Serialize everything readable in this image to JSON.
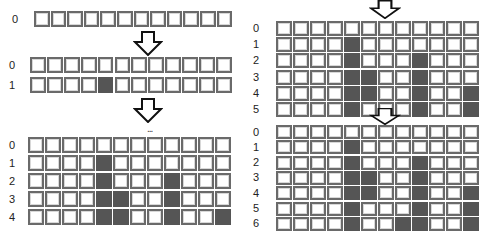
{
  "colors": {
    "filled": "#555555",
    "border": "#6a6a6a",
    "empty": "#ffffff"
  },
  "columns": 12,
  "grids": [
    {
      "id": "step-1",
      "x": 34,
      "y": 11,
      "cellW": 16.6,
      "cellH": 16,
      "pitchY": 18,
      "labelX": 12,
      "rows": [
        {
          "label": "0",
          "filled": []
        }
      ]
    },
    {
      "id": "step-2",
      "x": 30,
      "y": 57,
      "cellW": 16.9,
      "cellH": 16,
      "pitchY": 20,
      "labelX": 9,
      "rows": [
        {
          "label": "0",
          "filled": []
        },
        {
          "label": "1",
          "filled": [
            4
          ]
        }
      ]
    },
    {
      "id": "step-3",
      "x": 28,
      "y": 137,
      "cellW": 17.0,
      "cellH": 16,
      "pitchY": 18,
      "labelX": 9,
      "rows": [
        {
          "label": "0",
          "filled": []
        },
        {
          "label": "1",
          "filled": [
            4
          ]
        },
        {
          "label": "2",
          "filled": [
            4,
            8
          ]
        },
        {
          "label": "3",
          "filled": [
            4,
            5,
            8
          ]
        },
        {
          "label": "4",
          "filled": [
            4,
            5,
            8,
            11
          ]
        }
      ]
    },
    {
      "id": "step-4",
      "x": 276,
      "y": 21,
      "cellW": 17.0,
      "cellH": 15,
      "pitchY": 16.2,
      "labelX": 253,
      "rows": [
        {
          "label": "0",
          "filled": []
        },
        {
          "label": "1",
          "filled": [
            4
          ]
        },
        {
          "label": "2",
          "filled": [
            4,
            8
          ]
        },
        {
          "label": "3",
          "filled": [
            4,
            5,
            8
          ]
        },
        {
          "label": "4",
          "filled": [
            4,
            5,
            8,
            11
          ]
        },
        {
          "label": "5",
          "filled": [
            4,
            8,
            11
          ]
        }
      ]
    },
    {
      "id": "step-5",
      "x": 276,
      "y": 125,
      "cellW": 17.0,
      "cellH": 14,
      "pitchY": 15.3,
      "labelX": 253,
      "rows": [
        {
          "label": "0",
          "filled": []
        },
        {
          "label": "1",
          "filled": [
            4
          ]
        },
        {
          "label": "2",
          "filled": [
            4,
            8
          ]
        },
        {
          "label": "3",
          "filled": [
            4,
            5,
            8
          ]
        },
        {
          "label": "4",
          "filled": [
            4,
            5,
            8,
            11
          ]
        },
        {
          "label": "5",
          "filled": [
            4,
            8,
            11
          ]
        },
        {
          "label": "6",
          "filled": [
            4,
            7,
            8,
            11
          ]
        }
      ]
    }
  ],
  "arrows": [
    {
      "id": "arrow-1",
      "x": 133,
      "y": 31,
      "w": 30,
      "h": 25
    },
    {
      "id": "arrow-2",
      "x": 133,
      "y": 98,
      "w": 30,
      "h": 25
    },
    {
      "id": "arrow-3",
      "x": 369,
      "y": 0,
      "w": 32,
      "h": 19
    },
    {
      "id": "arrow-4",
      "x": 369,
      "y": 108,
      "w": 32,
      "h": 17
    }
  ],
  "ellipsis": {
    "text": "...",
    "x": 147,
    "y": 124
  }
}
